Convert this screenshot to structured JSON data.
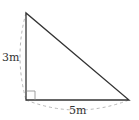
{
  "diagram": {
    "type": "right-triangle",
    "labels": {
      "vertical_side": "3m",
      "horizontal_side": "5m"
    },
    "colors": {
      "stroke": "#333333",
      "dashed": "#b0b0b0",
      "background": "#ffffff"
    },
    "vertices": {
      "top": [
        26,
        13
      ],
      "right_angle": [
        26,
        100
      ],
      "right": [
        129,
        100
      ]
    }
  }
}
